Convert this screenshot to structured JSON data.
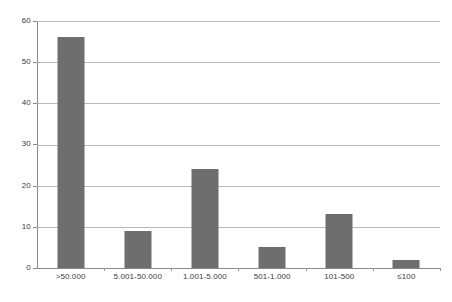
{
  "chart_data": {
    "type": "bar",
    "title": "",
    "subtitle": "",
    "xlabel": "",
    "ylabel": "",
    "categories": [
      ">50.000",
      "5.001-50.000",
      "1.001-5.000",
      "501-1.000",
      "101-500",
      "≤100"
    ],
    "values": [
      56,
      9,
      24,
      5,
      13,
      2
    ],
    "ylim": [
      0,
      60
    ],
    "yticks": [
      0,
      10,
      20,
      30,
      40,
      50,
      60
    ],
    "ytick_labels": [
      "0",
      "10",
      "20",
      "30",
      "40",
      "50",
      "60"
    ],
    "grid": true,
    "grid_axis": "y",
    "legend": "none",
    "series": [
      {
        "name": "",
        "values": [
          56,
          9,
          24,
          5,
          13,
          2
        ]
      }
    ],
    "colors": {
      "bar": "#6e6e6e",
      "gridline": "#b9b9b9",
      "axis": "#8a8a8a",
      "text": "#3b3b3b",
      "background": "#ffffff"
    }
  }
}
